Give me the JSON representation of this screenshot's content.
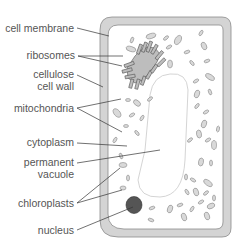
{
  "diagram": {
    "colors": {
      "wall_fill": "#d4d4d4",
      "wall_stroke": "#8a8a8a",
      "cytoplasm": "#ffffff",
      "vacuole_stroke": "#cfcfcf",
      "organelle_fill": "#d9d9d9",
      "organelle_stroke": "#8a8a8a",
      "nucleus_fill": "#555555",
      "leader_line": "#333333",
      "label_text": "#555555"
    },
    "labels": [
      {
        "id": "cell-membrane",
        "lines": [
          "cell membrane"
        ]
      },
      {
        "id": "ribosomes",
        "lines": [
          "ribosomes"
        ]
      },
      {
        "id": "cellulose-cell-wall",
        "lines": [
          "cellulose",
          "cell wall"
        ]
      },
      {
        "id": "mitochondria",
        "lines": [
          "mitochondria"
        ]
      },
      {
        "id": "cytoplasm",
        "lines": [
          "cytoplasm"
        ]
      },
      {
        "id": "permanent-vacuole",
        "lines": [
          "permanent",
          "vacuole"
        ]
      },
      {
        "id": "chloroplasts",
        "lines": [
          "chloroplasts"
        ]
      },
      {
        "id": "nucleus",
        "lines": [
          "nucleus"
        ]
      }
    ]
  }
}
